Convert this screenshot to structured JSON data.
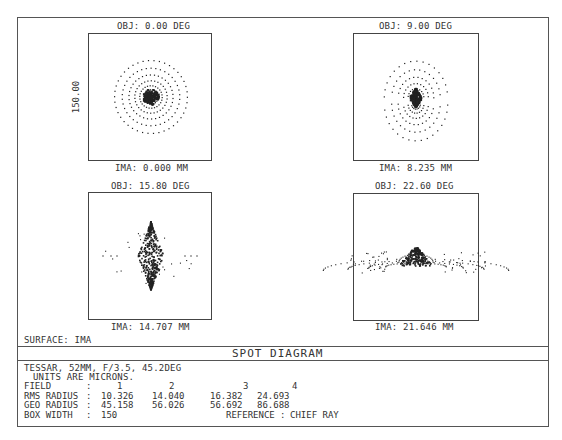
{
  "chart_data": {
    "type": "scatter",
    "title": "SPOT DIAGRAM",
    "surface": "SURFACE: IMA",
    "box_scale_label": "150.00",
    "units": "microns",
    "box_width": 150,
    "reference": "CHIEF RAY",
    "panels": [
      {
        "field": 1,
        "obj_label": "OBJ: 0.00 DEG",
        "ima_label": "IMA: 0.000 MM",
        "obj_deg": 0.0,
        "ima_mm": 0.0,
        "rms_radius": 10.326,
        "geo_radius": 45.158,
        "pattern": "symmetric"
      },
      {
        "field": 2,
        "obj_label": "OBJ: 9.00 DEG",
        "ima_label": "IMA: 8.235 MM",
        "obj_deg": 9.0,
        "ima_mm": 8.235,
        "rms_radius": 14.04,
        "geo_radius": 56.026,
        "pattern": "vertical-diamond"
      },
      {
        "field": 3,
        "obj_label": "OBJ: 15.80 DEG",
        "ima_label": "IMA: 14.707 MM",
        "obj_deg": 15.8,
        "ima_mm": 14.707,
        "rms_radius": 16.382,
        "geo_radius": 56.692,
        "pattern": "tall-diamond"
      },
      {
        "field": 4,
        "obj_label": "OBJ: 22.60 DEG",
        "ima_label": "IMA: 21.646 MM",
        "obj_deg": 22.6,
        "ima_mm": 21.646,
        "rms_radius": 24.693,
        "geo_radius": 86.688,
        "pattern": "coma-arch"
      }
    ],
    "xlabel": "",
    "ylabel": "150.00",
    "grid": false,
    "legend": "none"
  },
  "info": {
    "line1": "TESSAR, 52MM, F/3.5, 45.2DEG",
    "line2": "UNITS ARE MICRONS.",
    "rows": [
      {
        "label": "FIELD",
        "sep": ":",
        "values": [
          "1",
          "2",
          "3",
          "4"
        ]
      },
      {
        "label": "RMS RADIUS",
        "sep": ":",
        "values": [
          "10.326",
          "14.040",
          "16.382",
          "24.693"
        ]
      },
      {
        "label": "GEO RADIUS",
        "sep": ":",
        "values": [
          "45.158",
          "56.026",
          "56.692",
          "86.688"
        ]
      },
      {
        "label": "BOX WIDTH",
        "sep": ":",
        "values": [
          "150"
        ],
        "reference_label": "REFERENCE",
        "reference_sep": ":",
        "reference_value": "CHIEF RAY"
      }
    ]
  },
  "colors": {
    "ink": "#222222",
    "frame": "#555555",
    "background": "#ffffff"
  }
}
